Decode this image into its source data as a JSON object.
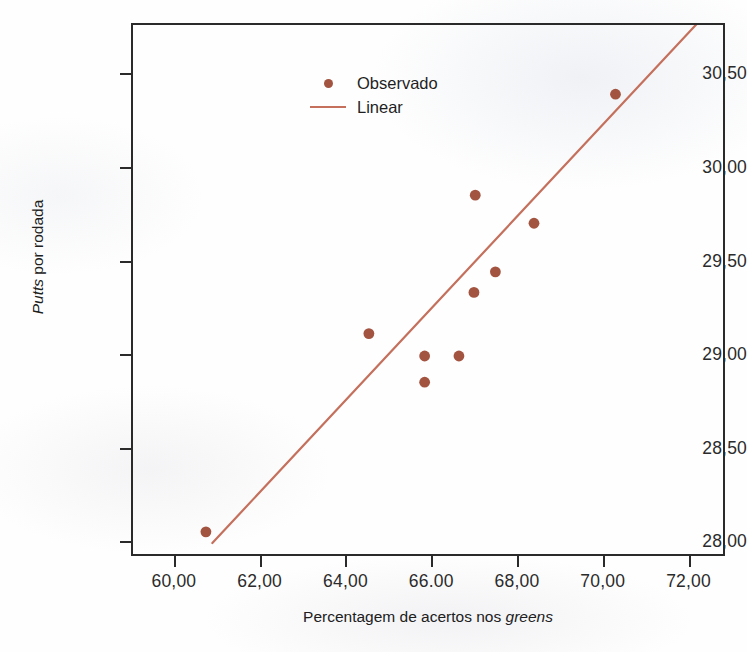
{
  "chart_data": {
    "type": "scatter",
    "title": "",
    "xlabel": "Percentagem de acertos nos greens",
    "xlabel_parts": {
      "plain": "Percentagem de acertos nos ",
      "italic": "greens"
    },
    "ylabel": "Putts por rodada",
    "ylabel_parts": {
      "italic": "Putts",
      "plain": " por rodada"
    },
    "xlim": [
      59.0,
      72.85
    ],
    "ylim": [
      27.92,
      30.77
    ],
    "grid": false,
    "legend_position": "top-left",
    "x_ticks": [
      "60,00",
      "62,00",
      "64,00",
      "66.00",
      "68,00",
      "70,00",
      "72,00"
    ],
    "x_tick_values": [
      60,
      62,
      64,
      66,
      68,
      70,
      72
    ],
    "y_ticks": [
      "28,00",
      "28,50",
      "29,00",
      "29,50",
      "30,00",
      "30,50"
    ],
    "y_tick_values": [
      28.0,
      28.5,
      29.0,
      29.5,
      30.0,
      30.5
    ],
    "series": [
      {
        "name": "Observado",
        "type": "scatter",
        "color": "#a35440",
        "marker": "circle",
        "points": [
          {
            "x": 60.7,
            "y": 28.06
          },
          {
            "x": 64.5,
            "y": 29.12
          },
          {
            "x": 65.8,
            "y": 29.0
          },
          {
            "x": 65.8,
            "y": 28.86
          },
          {
            "x": 66.6,
            "y": 29.0
          },
          {
            "x": 66.95,
            "y": 29.34
          },
          {
            "x": 66.98,
            "y": 29.86
          },
          {
            "x": 67.45,
            "y": 29.45
          },
          {
            "x": 68.35,
            "y": 29.71
          },
          {
            "x": 70.25,
            "y": 30.4
          }
        ]
      },
      {
        "name": "Linear",
        "type": "line",
        "color": "#c4705c",
        "endpoints": [
          {
            "x": 60.85,
            "y": 28.0
          },
          {
            "x": 72.0,
            "y": 30.74
          }
        ]
      }
    ],
    "legend": [
      {
        "label": "Observado",
        "marker": "dot",
        "color": "#a35440"
      },
      {
        "label": "Linear",
        "marker": "line",
        "color": "#c4705c"
      }
    ]
  },
  "colors": {
    "point": "#a35440",
    "line": "#c4705c",
    "frame": "#2a2a2a",
    "text": "#1f1f1f",
    "background": "#fefefe"
  }
}
